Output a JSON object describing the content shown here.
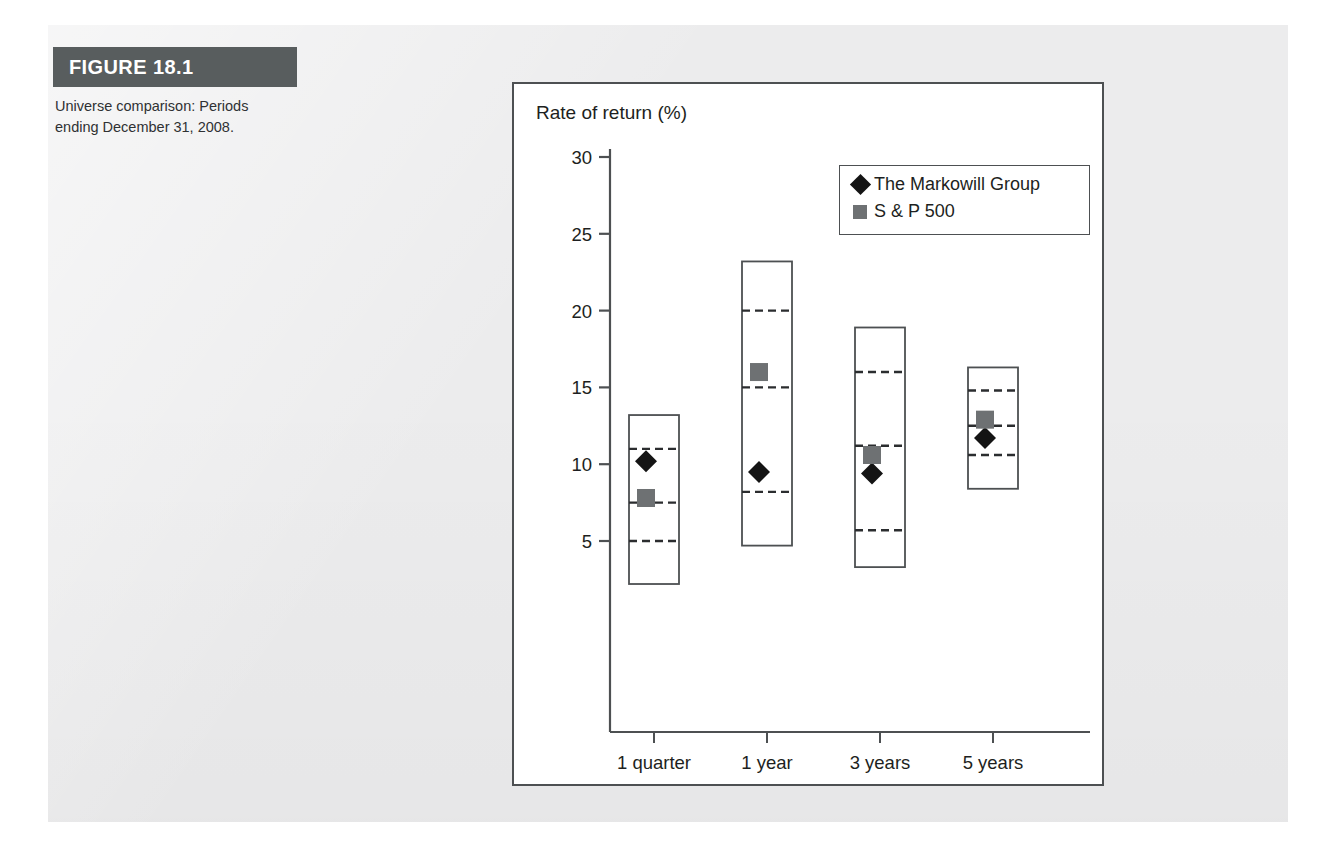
{
  "figure": {
    "label": "FIGURE 18.1",
    "caption": "Universe comparison: Periods ending December 31, 2008.",
    "header_color": "#585d5e",
    "page_color": "#ececed"
  },
  "legend": {
    "items": [
      {
        "name": "The Markowill Group",
        "marker": "diamond",
        "color": "#141414"
      },
      {
        "name": "S & P 500",
        "marker": "square",
        "color": "#6e7173"
      }
    ]
  },
  "chart_data": {
    "type": "box",
    "title": "Rate of return (%)",
    "xlabel": "",
    "ylabel": "Rate of return (%)",
    "ylim": [
      0,
      32
    ],
    "yticks": [
      5,
      10,
      15,
      20,
      25,
      30
    ],
    "ytick_labels": [
      "5",
      "10",
      "15",
      "20",
      "25",
      "30"
    ],
    "grid": false,
    "legend_position": "upper-right",
    "categories": [
      "1 quarter",
      "1 year",
      "3 years",
      "5 years"
    ],
    "boxes": [
      {
        "category": "1 quarter",
        "min": 2.2,
        "q1": 5.0,
        "median": 7.5,
        "q3": 11.0,
        "max": 13.2
      },
      {
        "category": "1 year",
        "min": 4.7,
        "q1": 8.2,
        "median": 15.0,
        "q3": 20.0,
        "max": 23.2
      },
      {
        "category": "3 years",
        "min": 3.3,
        "q1": 5.7,
        "median": 11.2,
        "q3": 16.0,
        "max": 18.9
      },
      {
        "category": "5 years",
        "min": 8.4,
        "q1": 10.6,
        "median": 12.5,
        "q3": 14.8,
        "max": 16.3
      }
    ],
    "series": [
      {
        "name": "The Markowill Group",
        "marker": "diamond",
        "color": "#141414",
        "values": [
          10.2,
          9.5,
          9.4,
          11.7
        ]
      },
      {
        "name": "S & P 500",
        "marker": "square",
        "color": "#6e7173",
        "values": [
          7.8,
          16.0,
          10.6,
          12.9
        ]
      }
    ]
  }
}
